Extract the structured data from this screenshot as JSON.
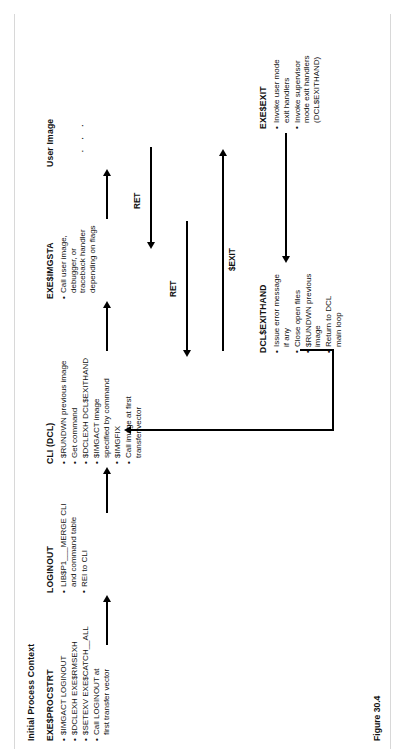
{
  "figure": {
    "caption": "Figure 30.4",
    "context_title": "Initial Process Context",
    "dots": "· · ·"
  },
  "blocks": [
    {
      "id": "procstrt",
      "title": "EXE$PROCSTRT",
      "bullets": [
        "$IMGACT  LOGINOUT",
        "$DCLEXH  EXE$RMSEXH",
        "$SETEXV  EXE$CATCH__ALL",
        "Call LOGINOUT at\nfirst transfer vector"
      ]
    },
    {
      "id": "loginout",
      "title": "LOGINOUT",
      "bullets": [
        "LIB$P1___MERGE CLI\nand command table",
        "REI to CLI"
      ]
    },
    {
      "id": "cli",
      "title": "CLI (DCL)",
      "bullets": [
        "$RUNDWN previous image",
        "Get command",
        "$DCLEXH  DCL$EXITHAND",
        "$IMGACT image\nspecified by command",
        "$IMGFIX",
        "Call image at first\ntransfer vector"
      ]
    },
    {
      "id": "imgsta",
      "title": "EXE$IMGSTA",
      "bullets": [
        "Call user image,\ndebugger, or\ntraceback handler\ndepending on flags"
      ]
    },
    {
      "id": "userimage",
      "title": "User Image",
      "bullets": []
    },
    {
      "id": "exithand",
      "title": "DCL$EXITHAND",
      "bullets": [
        "Issue error message\nif any",
        "Close open files",
        "$RUNDWN previous\nimage",
        "Return to DCL\nmain loop"
      ]
    },
    {
      "id": "exeexit",
      "title": "EXE$EXIT",
      "bullets": [
        "Invoke user mode\nexit handlers",
        "Invoke supervisor\nmode exit handlers\n(DCL$EXITHAND)"
      ]
    }
  ],
  "arrow_labels": {
    "ret_upper": "RET",
    "ret_lower": "RET",
    "exit": "$EXIT"
  }
}
